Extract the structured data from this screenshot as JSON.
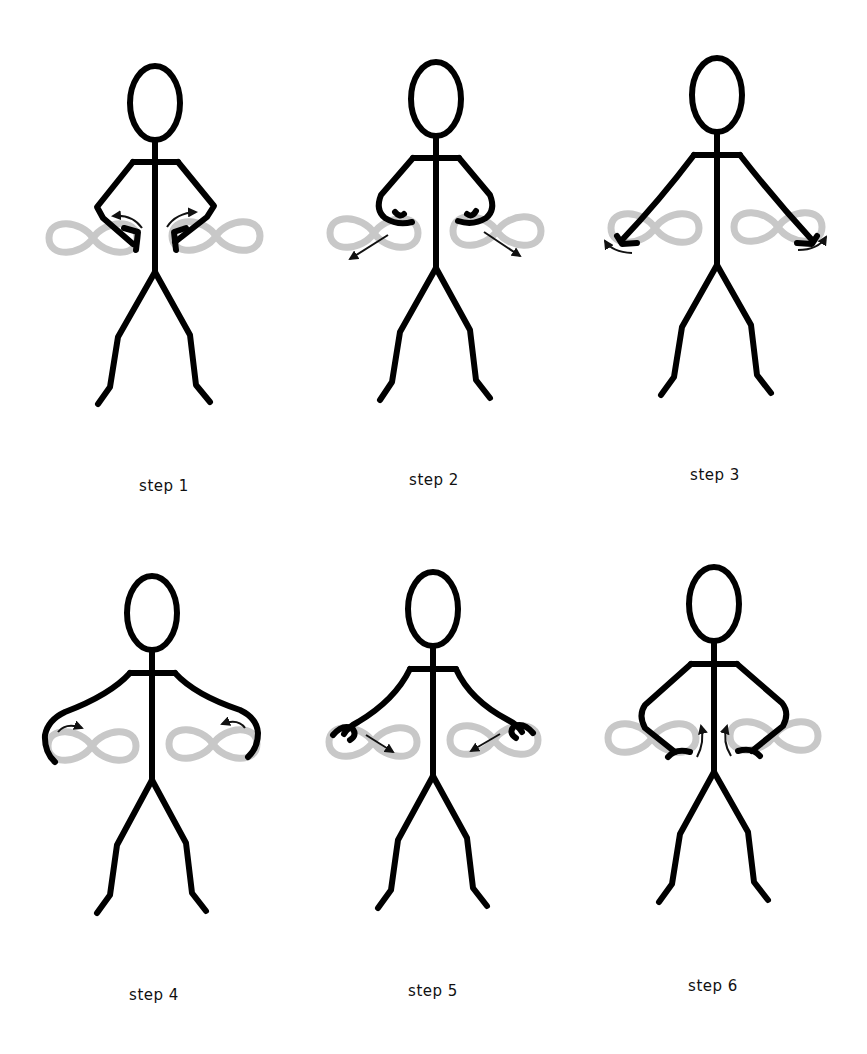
{
  "diagram": {
    "title": "",
    "colors": {
      "figure": "#000000",
      "infinity_loop": "#c8c8c8",
      "arrow": "#111111",
      "background": "#ffffff"
    },
    "steps": [
      {
        "label": "step 1",
        "arm_position": "hands on hips, fists at inner loop",
        "arrow_direction": "outward-up curved"
      },
      {
        "label": "step 2",
        "arm_position": "hands at waist, fists at inner loop top",
        "arrow_direction": "diagonal down-outward"
      },
      {
        "label": "step 3",
        "arm_position": "arms extended down-out, fists at outer loop bottom",
        "arrow_direction": "curved up-outward at outer ends"
      },
      {
        "label": "step 4",
        "arm_position": "arms wide, fists at outer loop edge",
        "arrow_direction": "curved inward along loop top"
      },
      {
        "label": "step 5",
        "arm_position": "arms out, fists at outer loop top",
        "arrow_direction": "diagonal down-inward"
      },
      {
        "label": "step 6",
        "arm_position": "hands on hips, fists at inner loop bottom",
        "arrow_direction": "curved upward near torso"
      }
    ]
  }
}
